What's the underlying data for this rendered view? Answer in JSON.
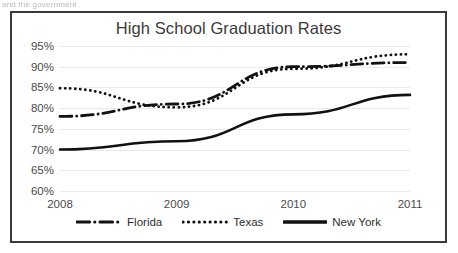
{
  "page": {
    "clipped_header_text": "and the government"
  },
  "chart_data": {
    "type": "line",
    "title": "High School Graduation Rates",
    "xlabel": "",
    "ylabel": "",
    "categories": [
      "2008",
      "2009",
      "2010",
      "2011"
    ],
    "x": [
      2008,
      2009,
      2010,
      2011
    ],
    "xlim": [
      2008,
      2011
    ],
    "ylim": [
      60,
      95
    ],
    "ytick_labels": [
      "95%",
      "90%",
      "85%",
      "80%",
      "75%",
      "70%",
      "65%",
      "60%"
    ],
    "ytick_values": [
      95,
      90,
      85,
      80,
      75,
      70,
      65,
      60
    ],
    "grid": true,
    "legend_position": "bottom",
    "series": [
      {
        "name": "Florida",
        "style": "dash-dot",
        "color": "#111111",
        "values": [
          78.0,
          81.0,
          90.0,
          91.0
        ]
      },
      {
        "name": "Texas",
        "style": "dotted",
        "color": "#111111",
        "values": [
          84.8,
          80.2,
          89.5,
          93.0
        ]
      },
      {
        "name": "New York",
        "style": "solid",
        "color": "#111111",
        "values": [
          70.0,
          72.0,
          78.5,
          83.2
        ]
      }
    ]
  },
  "legend": {
    "items": [
      {
        "label": "Florida",
        "style": "dash-dot"
      },
      {
        "label": "Texas",
        "style": "dotted"
      },
      {
        "label": "New York",
        "style": "solid"
      }
    ]
  }
}
